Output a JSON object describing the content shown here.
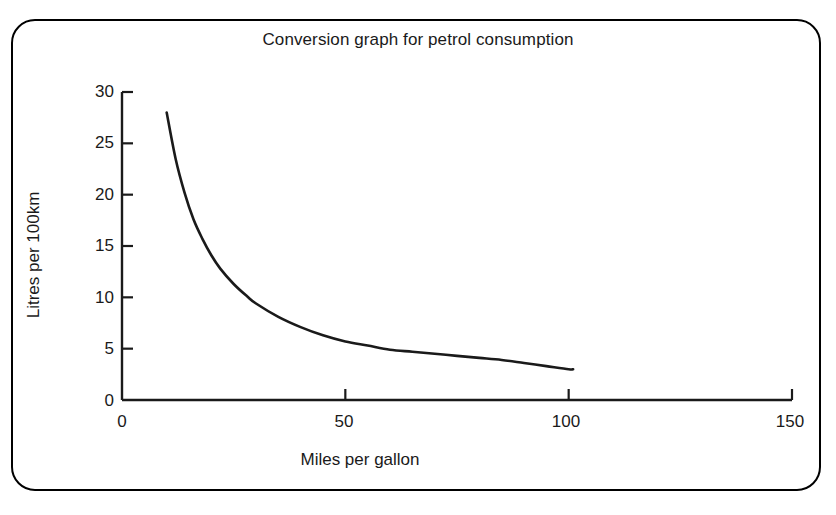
{
  "figure": {
    "border_color": "#000000",
    "background": "#ffffff",
    "line_color": "#1a1a1a"
  },
  "chart_data": {
    "type": "line",
    "title": "Conversion graph for petrol consumption",
    "xlabel": "Miles per gallon",
    "ylabel": "Litres per 100km",
    "xlim": [
      0,
      150
    ],
    "ylim": [
      0,
      30
    ],
    "grid": false,
    "legend": null,
    "xticks": [
      0,
      50,
      100,
      150
    ],
    "xtick_labels": [
      "0",
      "50",
      "100",
      "150"
    ],
    "yticks": [
      0,
      5,
      10,
      15,
      20,
      25,
      30
    ],
    "ytick_labels": [
      "0",
      "5",
      "10",
      "15",
      "20",
      "25",
      "30"
    ],
    "series": [
      {
        "name": "Petrol consumption conversion",
        "color": "#1a1a1a",
        "x": [
          10,
          12,
          14,
          16,
          18,
          20,
          22,
          25,
          28,
          30,
          35,
          40,
          45,
          50,
          55,
          60,
          65,
          70,
          75,
          80,
          85,
          90,
          95,
          100,
          101
        ],
        "y": [
          28.0,
          23.5,
          20.2,
          17.6,
          15.7,
          14.1,
          12.8,
          11.3,
          10.1,
          9.4,
          8.1,
          7.1,
          6.3,
          5.7,
          5.3,
          4.9,
          4.7,
          4.5,
          4.3,
          4.1,
          3.9,
          3.6,
          3.3,
          3.0,
          3.0
        ]
      }
    ]
  }
}
